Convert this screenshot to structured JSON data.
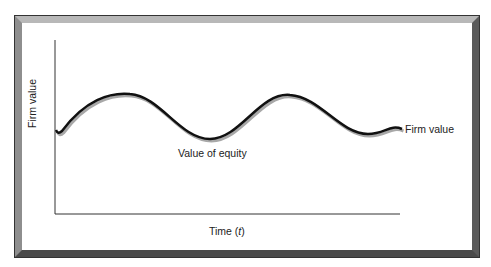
{
  "diagram": {
    "y_axis_label": "Firm value",
    "x_axis_label_prefix": "Time (",
    "x_axis_label_var": "t",
    "x_axis_label_suffix": ")",
    "curve_label": "Firm value",
    "region_label": "Value of equity",
    "colors": {
      "curve": "#111111",
      "shadow": "#a0a0a0",
      "frame_light": "#b8b8b8",
      "frame_dark": "#4a4a4a"
    }
  }
}
